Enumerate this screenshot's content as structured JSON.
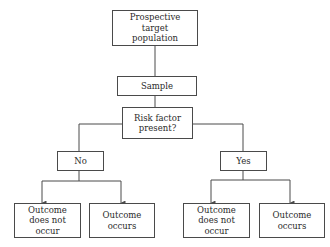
{
  "diagram": {
    "type": "flowchart",
    "nodes": {
      "population": {
        "label": "Prospective\ntarget\npopulation"
      },
      "sample": {
        "label": "Sample"
      },
      "risk": {
        "label": "Risk factor\npresent?"
      },
      "no": {
        "label": "No"
      },
      "yes": {
        "label": "Yes"
      },
      "no_not_occur": {
        "label": "Outcome\ndoes not\noccur"
      },
      "no_occurs": {
        "label": "Outcome\noccurs"
      },
      "yes_not_occur": {
        "label": "Outcome\ndoes not\noccur"
      },
      "yes_occurs": {
        "label": "Outcome\noccurs"
      }
    },
    "edges": [
      {
        "from": "population",
        "to": "sample"
      },
      {
        "from": "sample",
        "to": "risk"
      },
      {
        "from": "risk",
        "to": "no"
      },
      {
        "from": "risk",
        "to": "yes"
      },
      {
        "from": "no",
        "to": "no_not_occur",
        "arrow": true
      },
      {
        "from": "no",
        "to": "no_occurs",
        "arrow": true
      },
      {
        "from": "yes",
        "to": "yes_not_occur",
        "arrow": true
      },
      {
        "from": "yes",
        "to": "yes_occurs",
        "arrow": true
      }
    ],
    "colors": {
      "line": "#4a4a4a",
      "text": "#2a2a2a",
      "background": "#ffffff"
    }
  }
}
